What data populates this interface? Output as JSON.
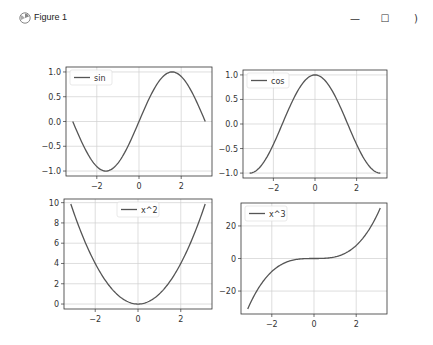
{
  "window": {
    "title": "Figure 1",
    "icon": "matplotlib-icon",
    "controls": {
      "minimize": "—",
      "maximize": "☐",
      "close": ")"
    }
  },
  "chart_data": [
    {
      "type": "line",
      "position": "top-left",
      "series": [
        {
          "name": "sin",
          "function": "sin(x)",
          "x": [
            -3.14,
            -2.5,
            -2,
            -1.57,
            -1,
            -0.5,
            0,
            0.5,
            1,
            1.57,
            2,
            2.5,
            3.14
          ],
          "values": [
            0,
            -0.6,
            -0.91,
            -1,
            -0.84,
            -0.48,
            0,
            0.48,
            0.84,
            1,
            0.91,
            0.6,
            0
          ]
        }
      ],
      "legend": [
        "sin"
      ],
      "legend_position": "upper left",
      "xticks": [
        "−2",
        "0",
        "2"
      ],
      "yticks": [
        "−1.0",
        "−0.5",
        "0.0",
        "0.5",
        "1.0"
      ],
      "xlim": [
        -3.46,
        3.46
      ],
      "ylim": [
        -1.1,
        1.1
      ],
      "grid": true,
      "xlabel": "",
      "ylabel": "",
      "title": ""
    },
    {
      "type": "line",
      "position": "top-right",
      "series": [
        {
          "name": "cos",
          "function": "cos(x)",
          "x": [
            -3.14,
            -2.5,
            -2,
            -1.57,
            -1,
            -0.5,
            0,
            0.5,
            1,
            1.57,
            2,
            2.5,
            3.14
          ],
          "values": [
            -1,
            -0.8,
            -0.42,
            0,
            0.54,
            0.88,
            1,
            0.88,
            0.54,
            0,
            -0.42,
            -0.8,
            -1
          ]
        }
      ],
      "legend": [
        "cos"
      ],
      "legend_position": "upper left",
      "xticks": [
        "−2",
        "0",
        "2"
      ],
      "yticks": [
        "−1.0",
        "−0.5",
        "0.0",
        "0.5",
        "1.0"
      ],
      "xlim": [
        -3.46,
        3.46
      ],
      "ylim": [
        -1.1,
        1.1
      ],
      "grid": true,
      "xlabel": "",
      "ylabel": "",
      "title": ""
    },
    {
      "type": "line",
      "position": "bottom-left",
      "series": [
        {
          "name": "x^2",
          "function": "x^2",
          "x": [
            -3.14,
            -2,
            -1,
            0,
            1,
            2,
            3.14
          ],
          "values": [
            9.87,
            4,
            1,
            0,
            1,
            4,
            9.87
          ]
        }
      ],
      "legend": [
        "x^2"
      ],
      "legend_position": "upper center",
      "xticks": [
        "−2",
        "0",
        "2"
      ],
      "yticks": [
        "0",
        "2",
        "4",
        "6",
        "8",
        "10"
      ],
      "xlim": [
        -3.46,
        3.46
      ],
      "ylim": [
        -0.49,
        10.36
      ],
      "grid": true,
      "xlabel": "",
      "ylabel": "",
      "title": ""
    },
    {
      "type": "line",
      "position": "bottom-right",
      "series": [
        {
          "name": "x^3",
          "function": "x^3",
          "x": [
            -3.14,
            -2,
            -1,
            0,
            1,
            2,
            3.14
          ],
          "values": [
            -31,
            -8,
            -1,
            0,
            1,
            8,
            31
          ]
        }
      ],
      "legend": [
        "x^3"
      ],
      "legend_position": "upper left",
      "xticks": [
        "−2",
        "0",
        "2"
      ],
      "yticks": [
        "−20",
        "0",
        "20"
      ],
      "xlim": [
        -3.46,
        3.46
      ],
      "ylim": [
        -34.1,
        34.1
      ],
      "grid": true,
      "xlabel": "",
      "ylabel": "",
      "title": ""
    }
  ],
  "colors": {
    "line": "#555555",
    "grid": "#d0d0d0",
    "axes": "#333333",
    "text": "#333333"
  }
}
